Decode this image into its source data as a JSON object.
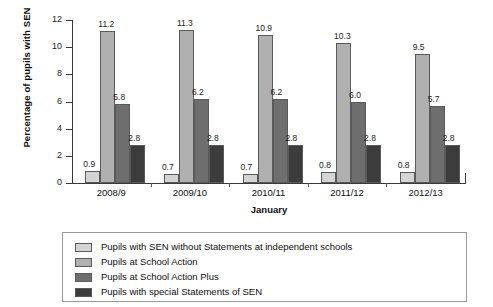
{
  "chart_data": {
    "type": "bar",
    "title": "",
    "xlabel": "January",
    "ylabel": "Percentage of pupils with SEN",
    "ylim": [
      0,
      12
    ],
    "yticks": [
      0,
      2,
      4,
      6,
      8,
      10,
      12
    ],
    "grid": false,
    "legend_position": "bottom",
    "categories": [
      "2008/9",
      "2009/10",
      "2010/11",
      "2011/12",
      "2012/13"
    ],
    "series": [
      {
        "name": "Pupils with SEN without Statements at independent schools",
        "color": "#d4d4d4",
        "values": [
          0.9,
          0.7,
          0.7,
          0.8,
          0.8
        ]
      },
      {
        "name": "Pupils at School Action",
        "color": "#b0b0b0",
        "values": [
          11.2,
          11.3,
          10.9,
          10.3,
          9.5
        ]
      },
      {
        "name": "Pupils at School Action Plus",
        "color": "#6e6e6e",
        "values": [
          5.8,
          6.2,
          6.2,
          6.0,
          5.7
        ]
      },
      {
        "name": "Pupils with special Statements of SEN",
        "color": "#3c3c3c",
        "values": [
          2.8,
          2.8,
          2.8,
          2.8,
          2.8
        ]
      }
    ]
  }
}
